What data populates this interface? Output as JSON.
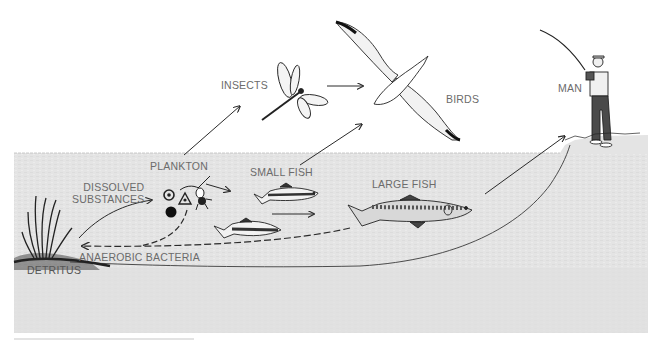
{
  "diagram": {
    "type": "food-chain / ecological cycle illustration",
    "colors": {
      "water": "#e4e4e4",
      "water_texture": "#d9d9d9",
      "line": "#2a2a2a",
      "label": "#6b6b6b",
      "background": "#ffffff"
    },
    "labels": {
      "insects": "INSECTS",
      "birds": "BIRDS",
      "man": "MAN",
      "plankton": "PLANKTON",
      "small_fish": "SMALL FISH",
      "large_fish": "LARGE FISH",
      "dissolved_substances": "DISSOLVED\nSUBSTANCES",
      "anaerobic_bacteria": "ANAEROBIC BACTERIA",
      "detritus": "DETRITUS"
    },
    "nodes": [
      {
        "id": "dissolved_substances",
        "label": "DISSOLVED SUBSTANCES",
        "icon": "dissolved-particles-icon"
      },
      {
        "id": "plankton",
        "label": "PLANKTON",
        "icon": "plankton-icon"
      },
      {
        "id": "insects",
        "label": "INSECTS",
        "icon": "dragonfly-icon"
      },
      {
        "id": "small_fish",
        "label": "SMALL FISH",
        "icon": "small-fish-icon"
      },
      {
        "id": "large_fish",
        "label": "LARGE FISH",
        "icon": "trout-icon"
      },
      {
        "id": "birds",
        "label": "BIRDS",
        "icon": "albatross-icon"
      },
      {
        "id": "man",
        "label": "MAN",
        "icon": "fisherman-icon"
      },
      {
        "id": "detritus",
        "label": "DETRITUS",
        "icon": "reeds-icon"
      },
      {
        "id": "anaerobic_bacteria",
        "label": "ANAEROBIC BACTERIA"
      }
    ],
    "edges": [
      {
        "from": "detritus",
        "to": "dissolved_substances",
        "style": "solid"
      },
      {
        "from": "dissolved_substances",
        "to": "plankton",
        "style": "solid"
      },
      {
        "from": "plankton",
        "to": "insects",
        "style": "solid"
      },
      {
        "from": "plankton",
        "to": "small_fish",
        "style": "solid"
      },
      {
        "from": "insects",
        "to": "birds",
        "style": "solid"
      },
      {
        "from": "small_fish",
        "to": "birds",
        "style": "solid"
      },
      {
        "from": "small_fish",
        "to": "large_fish",
        "style": "solid"
      },
      {
        "from": "large_fish",
        "to": "man",
        "style": "solid"
      },
      {
        "from": "plankton",
        "to": "detritus",
        "style": "dashed",
        "via": "anaerobic_bacteria"
      },
      {
        "from": "large_fish",
        "to": "detritus",
        "style": "dashed",
        "via": "anaerobic_bacteria"
      }
    ]
  }
}
